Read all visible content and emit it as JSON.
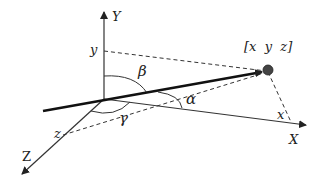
{
  "diagram": {
    "type": "3d-coordinate-direction-angles",
    "axes": {
      "x_label": "X",
      "y_label": "Y",
      "z_label": "Z"
    },
    "projections": {
      "x_label": "x",
      "y_label": "y",
      "z_label": "z"
    },
    "point_label": "[x  y  z]",
    "angles": {
      "alpha": "α",
      "beta": "β",
      "gamma": "γ"
    },
    "colors": {
      "line": "#222222",
      "point": "#444444",
      "background": "#ffffff"
    }
  }
}
